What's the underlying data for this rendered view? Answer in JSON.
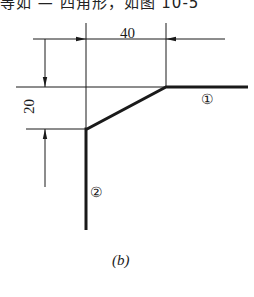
{
  "header": {
    "clipped_text": "等如 — 四角形，如图 10-5"
  },
  "figure": {
    "caption": "(b)",
    "dimensions": {
      "horizontal": "40",
      "vertical": "20"
    },
    "labels": {
      "part_1": "①",
      "part_2": "②"
    },
    "colors": {
      "line": "#1a1a1a",
      "background": "#ffffff"
    }
  }
}
